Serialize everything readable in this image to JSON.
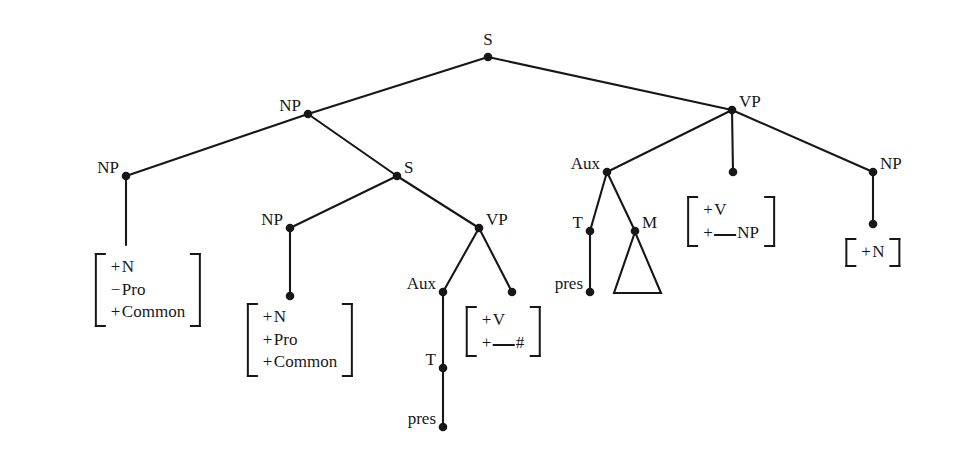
{
  "figure": {
    "type": "syntax-tree",
    "width": 963,
    "height": 462,
    "background_color": "#ffffff",
    "ink_color": "#171717"
  },
  "nodes": [
    {
      "id": "S-root",
      "label": "S",
      "x": 488,
      "y": 57,
      "dot": true,
      "label_side": "above"
    },
    {
      "id": "NP-upper",
      "label": "NP",
      "x": 308,
      "y": 114,
      "dot": true,
      "label_side": "left"
    },
    {
      "id": "VP-matrix",
      "label": "VP",
      "x": 732,
      "y": 110,
      "dot": true,
      "label_side": "right"
    },
    {
      "id": "NP-left",
      "label": "NP",
      "x": 126,
      "y": 176,
      "dot": true,
      "label_side": "left"
    },
    {
      "id": "S-embedded",
      "label": "S",
      "x": 397,
      "y": 176,
      "dot": true,
      "label_side": "right"
    },
    {
      "id": "Aux-right",
      "label": "Aux",
      "x": 607,
      "y": 172,
      "dot": true,
      "label_side": "left"
    },
    {
      "id": "V-right-dot",
      "label": "",
      "x": 733,
      "y": 172,
      "dot": true,
      "label_side": "none"
    },
    {
      "id": "NP-right",
      "label": "NP",
      "x": 873,
      "y": 172,
      "dot": true,
      "label_side": "right"
    },
    {
      "id": "NP-inner",
      "label": "NP",
      "x": 290,
      "y": 228,
      "dot": true,
      "label_side": "left"
    },
    {
      "id": "VP-embedded",
      "label": "VP",
      "x": 479,
      "y": 228,
      "dot": true,
      "label_side": "right"
    },
    {
      "id": "T-right",
      "label": "T",
      "x": 590,
      "y": 231,
      "dot": true,
      "label_side": "left"
    },
    {
      "id": "M-right",
      "label": "M",
      "x": 635,
      "y": 231,
      "dot": true,
      "label_side": "right"
    },
    {
      "id": "NP-right-term",
      "label": "",
      "x": 873,
      "y": 224,
      "dot": true,
      "label_side": "none"
    },
    {
      "id": "NP-inner-term",
      "label": "",
      "x": 290,
      "y": 296,
      "dot": true,
      "label_side": "none"
    },
    {
      "id": "Aux-left",
      "label": "Aux",
      "x": 443,
      "y": 292,
      "dot": true,
      "label_side": "left"
    },
    {
      "id": "V-left-dot",
      "label": "",
      "x": 512,
      "y": 292,
      "dot": true,
      "label_side": "none"
    },
    {
      "id": "pres-right",
      "label": "pres",
      "x": 590,
      "y": 292,
      "dot": true,
      "label_side": "left"
    },
    {
      "id": "T-left",
      "label": "T",
      "x": 443,
      "y": 368,
      "dot": true,
      "label_side": "left"
    },
    {
      "id": "pres-left",
      "label": "pres",
      "x": 443,
      "y": 427,
      "dot": true,
      "label_side": "left"
    }
  ],
  "edges": [
    {
      "from": "S-root",
      "to": "NP-upper"
    },
    {
      "from": "S-root",
      "to": "VP-matrix"
    },
    {
      "from": "NP-upper",
      "to": "NP-left"
    },
    {
      "from": "NP-upper",
      "to": "S-embedded"
    },
    {
      "from": "NP-left",
      "to": "NP-left-foot"
    },
    {
      "from": "S-embedded",
      "to": "NP-inner"
    },
    {
      "from": "S-embedded",
      "to": "VP-embedded"
    },
    {
      "from": "NP-inner",
      "to": "NP-inner-term"
    },
    {
      "from": "VP-embedded",
      "to": "Aux-left"
    },
    {
      "from": "VP-embedded",
      "to": "V-left-dot"
    },
    {
      "from": "Aux-left",
      "to": "T-left"
    },
    {
      "from": "T-left",
      "to": "pres-left"
    },
    {
      "from": "VP-matrix",
      "to": "Aux-right"
    },
    {
      "from": "VP-matrix",
      "to": "V-right-dot"
    },
    {
      "from": "VP-matrix",
      "to": "NP-right"
    },
    {
      "from": "Aux-right",
      "to": "T-right"
    },
    {
      "from": "Aux-right",
      "to": "M-right"
    },
    {
      "from": "T-right",
      "to": "pres-right"
    },
    {
      "from": "NP-right",
      "to": "NP-right-term"
    }
  ],
  "triangle": {
    "id": "m-triangle",
    "apex_x": 635,
    "apex_y": 232,
    "base_left_x": 614,
    "base_right_x": 661,
    "base_y": 293
  },
  "matrices": [
    {
      "id": "matrix-np-left",
      "x": 148,
      "y": 253,
      "rows": [
        {
          "sign": "+",
          "feature": "N"
        },
        {
          "sign": "−",
          "feature": "Pro"
        },
        {
          "sign": "+",
          "feature": "Common"
        }
      ]
    },
    {
      "id": "matrix-np-inner",
      "x": 300,
      "y": 303,
      "rows": [
        {
          "sign": "+",
          "feature": "N"
        },
        {
          "sign": "+",
          "feature": "Pro"
        },
        {
          "sign": "+",
          "feature": "Common"
        }
      ]
    },
    {
      "id": "matrix-v-embedded",
      "x": 503,
      "y": 306,
      "rows": [
        {
          "sign": "+",
          "feature": "V"
        },
        {
          "sign": "+",
          "blank": true,
          "feature": "#"
        }
      ]
    },
    {
      "id": "matrix-v-matrix",
      "x": 731,
      "y": 196,
      "rows": [
        {
          "sign": "+",
          "feature": "V"
        },
        {
          "sign": "+",
          "blank": true,
          "feature": "NP"
        }
      ]
    },
    {
      "id": "matrix-np-right",
      "x": 873,
      "y": 238,
      "rows": [
        {
          "sign": "+",
          "feature": "N"
        }
      ]
    }
  ],
  "node_labels": {
    "S": "S",
    "NP": "NP",
    "VP": "VP",
    "Aux": "Aux",
    "T": "T",
    "M": "M",
    "pres": "pres"
  }
}
